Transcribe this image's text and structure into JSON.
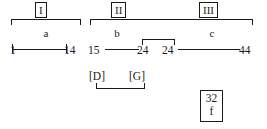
{
  "figure": {
    "type": "genetic-linkage-map-diagram",
    "background_color": "#ffffff",
    "line_color": "#1a1a1a"
  },
  "group_labels": [
    {
      "id": "group-1",
      "text": "I"
    },
    {
      "id": "group-2",
      "text": "II"
    },
    {
      "id": "group-3",
      "text": "III"
    }
  ],
  "segment_labels": [
    {
      "id": "segment-a",
      "text": "a"
    },
    {
      "id": "segment-b",
      "text": "b"
    },
    {
      "id": "segment-c",
      "text": "c"
    }
  ],
  "number_line": {
    "segments": [
      {
        "id": "segment-a-range",
        "start": "1",
        "end": "14"
      },
      {
        "id": "segment-b-range",
        "start": "15",
        "end": "24"
      },
      {
        "id": "segment-c-range",
        "start": "24",
        "end": "44"
      }
    ]
  },
  "markers": [
    {
      "id": "marker-d",
      "text": "[D]"
    },
    {
      "id": "marker-g",
      "text": "[G]"
    }
  ],
  "legend_box": {
    "value": "32",
    "label": "f"
  }
}
